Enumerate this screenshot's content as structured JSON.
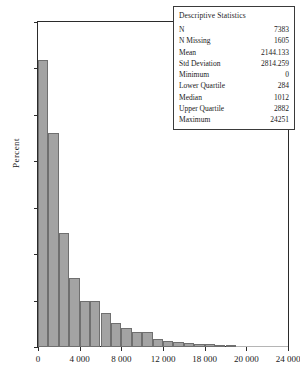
{
  "chart_data": {
    "type": "bar",
    "title": "",
    "xlabel": "",
    "ylabel": "Percent",
    "xlim": [
      0,
      24000
    ],
    "ylim": [
      0,
      35
    ],
    "grid": false,
    "legend": null,
    "bin_width": 1000,
    "x_tick_labels": [
      "0",
      "4 000",
      "8 000",
      "12 000",
      "18 000",
      "20 000",
      "24 000"
    ],
    "x_tick_values": [
      0,
      4000,
      8000,
      12000,
      16000,
      20000,
      24000
    ],
    "y_tick_labels": [
      "0",
      "5",
      "10",
      "15",
      "20",
      "25",
      "30",
      "35"
    ],
    "y_tick_values": [
      0,
      5,
      10,
      15,
      20,
      25,
      30,
      35
    ],
    "bin_centers": [
      500,
      1500,
      2500,
      3500,
      4500,
      5500,
      6500,
      7500,
      8500,
      9500,
      10500,
      11500,
      12500,
      13500,
      14500,
      15500,
      16500,
      17500,
      18500,
      19500,
      20500,
      21500,
      22500,
      23500
    ],
    "values": [
      30.9,
      23.1,
      12.3,
      7.4,
      5.0,
      5.0,
      3.7,
      2.6,
      2.0,
      1.6,
      1.6,
      0.9,
      0.7,
      0.5,
      0.4,
      0.35,
      0.3,
      0.2,
      0.2,
      0.15,
      0.15,
      0.1,
      0.1,
      0.1
    ]
  },
  "axes": {
    "y_label": "Percent"
  },
  "stats_box": {
    "title": "Descriptive Statistics",
    "rows": [
      {
        "key": "N",
        "value": "7383"
      },
      {
        "key": "N Missing",
        "value": "1605"
      },
      {
        "key": "Mean",
        "value": "2144.133"
      },
      {
        "key": "Std Deviation",
        "value": "2814.259"
      },
      {
        "key": "Minimum",
        "value": "0"
      },
      {
        "key": "Lower Quartile",
        "value": "284"
      },
      {
        "key": "Median",
        "value": "1012"
      },
      {
        "key": "Upper Quartile",
        "value": "2882"
      },
      {
        "key": "Maximum",
        "value": "24251"
      }
    ]
  },
  "caption": {
    "text": ""
  },
  "colors": {
    "bar_fill": "#a3a3a3",
    "bar_edge": "#6f6f6f",
    "axis": "#2b2b2b",
    "text": "#1a1a1a"
  }
}
